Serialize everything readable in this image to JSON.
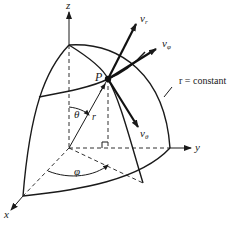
{
  "figure": {
    "type": "spherical-coordinate-system",
    "axes": {
      "z_label": "z",
      "y_label": "y",
      "x_label": "x"
    },
    "point_label": "P",
    "radius_label": "r",
    "angles": {
      "polar_label": "θ",
      "azimuth_label": "φ"
    },
    "vectors": {
      "radial": {
        "label": "v",
        "sub": "r"
      },
      "azimuthal": {
        "label": "v",
        "sub": "φ"
      },
      "polar": {
        "label": "v",
        "sub": "θ"
      }
    },
    "surface_label": "r = constant",
    "colors": {
      "ink": "#1a1a1a",
      "background": "#ffffff"
    }
  }
}
